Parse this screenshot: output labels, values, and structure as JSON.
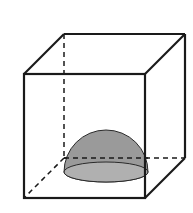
{
  "figure": {
    "colors": {
      "background": "#ffffff",
      "edge": "#1a1a1a",
      "hemisphere_fill": "#9a9a9a",
      "hemisphere_base": "#b4b4b4"
    },
    "cube": {
      "front_face": {
        "x1": 24,
        "y1": 74,
        "x2": 145,
        "y2": 198
      },
      "back_offset": {
        "dx": 40,
        "dy": -40
      },
      "hidden_edges": "dashed"
    },
    "hemisphere": {
      "cx": 106,
      "cy": 172,
      "rx": 42,
      "ry": 10,
      "height": 42
    }
  }
}
